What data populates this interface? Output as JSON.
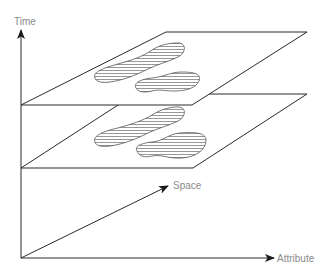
{
  "diagram": {
    "type": "space-time-attribute cube with stacked time-slice planes",
    "axes": {
      "time": {
        "label": "Time"
      },
      "space": {
        "label": "Space"
      },
      "attribute": {
        "label": "Attribute"
      }
    },
    "planes": [
      {
        "name": "upper time slice",
        "features": 2,
        "fill_pattern": "horizontal hatch"
      },
      {
        "name": "lower time slice",
        "features": 2,
        "fill_pattern": "horizontal hatch"
      }
    ],
    "colors": {
      "line": "#2a2a2a",
      "label": "#8a8a8a",
      "background": "#ffffff"
    }
  }
}
